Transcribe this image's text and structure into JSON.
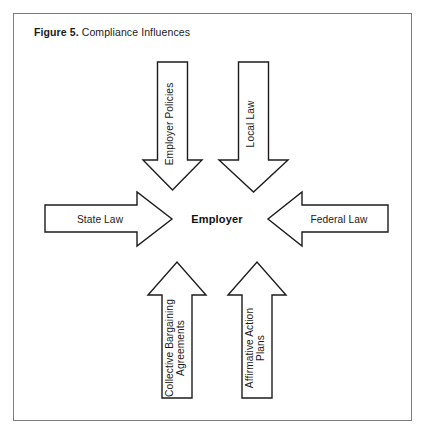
{
  "figure": {
    "number": "Figure 5.",
    "title": "Compliance Influences"
  },
  "center": {
    "label": "Employer"
  },
  "arrows": {
    "top_left": {
      "label": "Employer Policies",
      "direction": "down"
    },
    "top_right": {
      "label": "Local Law",
      "direction": "down"
    },
    "left": {
      "label": "State Law",
      "direction": "right"
    },
    "right": {
      "label": "Federal Law",
      "direction": "left"
    },
    "bottom_left": {
      "label_line1": "Collective Bargaining",
      "label_line2": "Agreements",
      "direction": "up"
    },
    "bottom_right": {
      "label_line1": "Affirmative Action",
      "label_line2": "Plans",
      "direction": "up"
    }
  },
  "colors": {
    "frame_border": "#7d7d7d",
    "arrow_stroke": "#1c1c1c",
    "arrow_fill": "#ffffff",
    "text": "#1a1a1a",
    "background": "#ffffff"
  }
}
